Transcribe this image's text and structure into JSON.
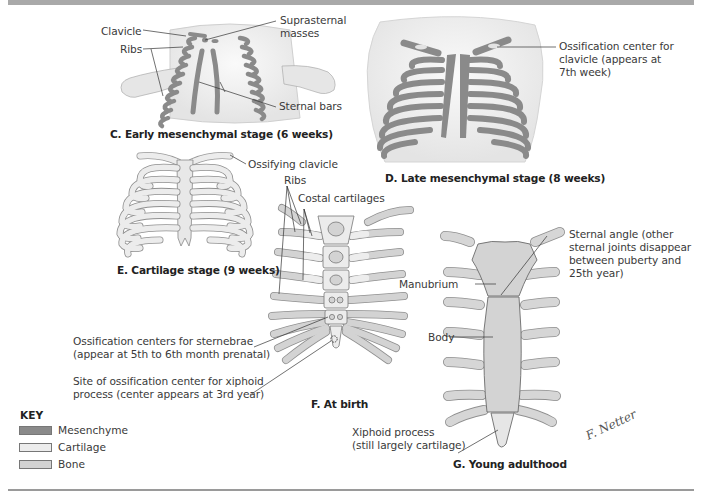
{
  "figure": {
    "colors": {
      "mesenchyme": "#8a8a8a",
      "cartilage": "#ececec",
      "bone": "#d3d3d3",
      "skin": "#f1f1f1",
      "outline": "#6b6b6b",
      "header_bar": "#a9a9a9"
    },
    "panels": {
      "c": {
        "caption": "C. Early mesenchymal stage (6 weeks)",
        "labels": {
          "clavicle": "Clavicle",
          "ribs": "Ribs",
          "suprasternal_1": "Suprasternal",
          "suprasternal_2": "masses",
          "sternal_bars": "Sternal bars"
        }
      },
      "d": {
        "caption": "D. Late mesenchymal stage (8 weeks)",
        "labels": {
          "ossification_clavicle_1": "Ossification center for",
          "ossification_clavicle_2": "clavicle (appears at",
          "ossification_clavicle_3": "7th week)"
        }
      },
      "e": {
        "caption": "E. Cartilage stage (9 weeks)",
        "labels": {
          "ossifying_clavicle": "Ossifying clavicle"
        }
      },
      "f": {
        "caption": "F. At birth",
        "labels": {
          "ribs": "Ribs",
          "costal_cartilages": "Costal cartilages",
          "sternebrae_1": "Ossification centers for sternebrae",
          "sternebrae_2": "(appear at 5th to 6th month prenatal)",
          "xiphoid_site_1": "Site of ossification center for xiphoid",
          "xiphoid_site_2": "process (center appears at 3rd year)"
        }
      },
      "g": {
        "caption": "G. Young adulthood",
        "labels": {
          "sternal_angle_1": "Sternal angle (other",
          "sternal_angle_2": "sternal joints disappear",
          "sternal_angle_3": "between puberty and",
          "sternal_angle_4": "25th year)",
          "manubrium": "Manubrium",
          "body": "Body",
          "xiphoid_1": "Xiphoid process",
          "xiphoid_2": "(still largely cartilage)"
        }
      }
    },
    "key": {
      "title": "KEY",
      "items": [
        {
          "label": "Mesenchyme",
          "color": "#8a8a8a"
        },
        {
          "label": "Cartilage",
          "color": "#ececec"
        },
        {
          "label": "Bone",
          "color": "#d3d3d3"
        }
      ]
    },
    "signature": "F. Netter"
  }
}
